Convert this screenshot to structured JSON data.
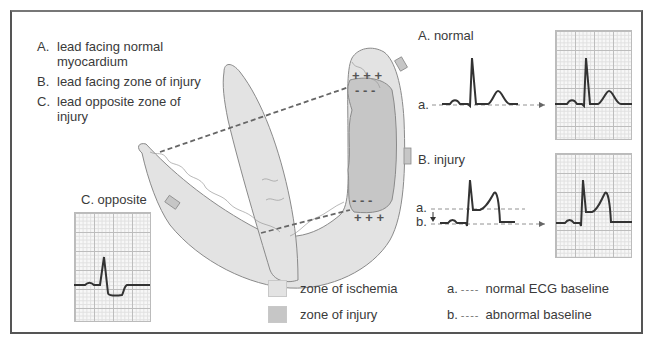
{
  "figure": {
    "leads_legend": [
      {
        "letter": "A.",
        "text": "lead facing normal myocardium"
      },
      {
        "letter": "B.",
        "text": "lead facing zone of injury"
      },
      {
        "letter": "C.",
        "text": "lead opposite zone of injury"
      }
    ],
    "panels": {
      "normal": {
        "title": "A. normal",
        "baseline_label": "a."
      },
      "injury": {
        "title": "B. injury",
        "baseline_a_label": "a.",
        "baseline_b_label": "b."
      },
      "opposite": {
        "title": "C. opposite"
      }
    },
    "heart_markers": {
      "top_plus": "+ + +",
      "top_minus": "- - -",
      "bottom_minus": "- - -",
      "bottom_plus": "+ + +"
    },
    "zone_legend": [
      {
        "label": "zone of ischemia",
        "color": "#e3e3e3"
      },
      {
        "label": "zone of injury",
        "color": "#c6c6c6"
      }
    ],
    "baseline_legend": [
      {
        "letter": "a.",
        "dash": "----",
        "label": "normal ECG baseline"
      },
      {
        "letter": "b.",
        "dash": "----",
        "label": "abnormal baseline"
      }
    ],
    "colors": {
      "ischemia": "#e3e3e3",
      "injury": "#c6c6c6",
      "outline": "#8a8a8a",
      "trace": "#333333",
      "frame": "#555555"
    }
  }
}
